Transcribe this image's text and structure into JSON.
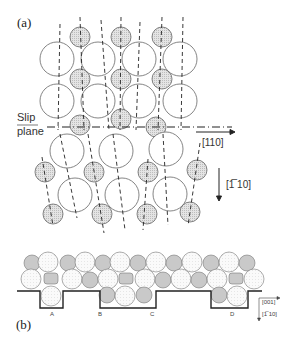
{
  "figure": {
    "panel_a": {
      "label": "(a)",
      "slip_label_line1": "Slip",
      "slip_label_line2": "plane",
      "direction_horizontal": "[110]",
      "direction_vertical": "[̅1̅10]",
      "direction_vertical_text": "[1̅ 10]"
    },
    "panel_b": {
      "label": "(b)",
      "step_labels": [
        "A",
        "B",
        "C",
        "D"
      ],
      "axis_label_x": "[001]",
      "axis_label_y": "[1̅ 10]"
    },
    "colors": {
      "large_atom_fill": "#ffffff",
      "small_atom_fill": "#d6d6d6",
      "outline": "#555555",
      "step_line": "#222222"
    }
  }
}
